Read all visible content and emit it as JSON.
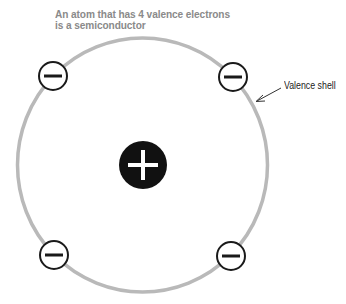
{
  "title": {
    "line1": "An atom that has 4 valence electrons",
    "line2": "is a semiconductor"
  },
  "labels": {
    "valence_shell": "Valence shell"
  },
  "atom": {
    "nucleus": {
      "charge_symbol": "+",
      "color": "#111111"
    },
    "shell_color": "#b9b9b9",
    "valence_electron_count": 4,
    "electron_charge_symbol": "−"
  },
  "colors": {
    "title": "#8a8a8a",
    "electron_stroke": "#1a1a1a",
    "background": "#ffffff"
  }
}
